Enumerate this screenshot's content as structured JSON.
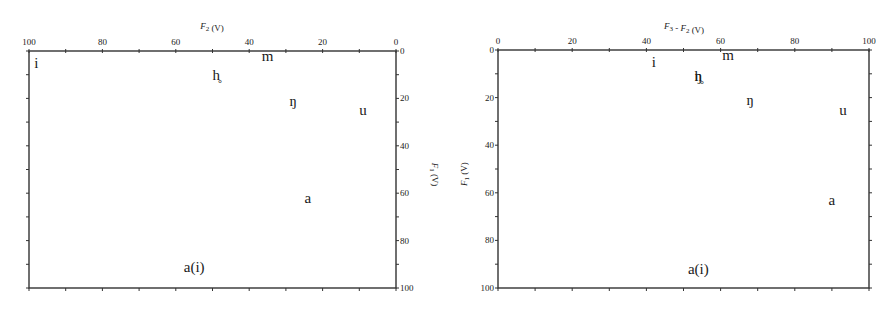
{
  "chart_data": [
    {
      "type": "scatter",
      "title": "",
      "xlabel": "F2 (V)",
      "ylabel": "F1 (V)",
      "xlim": [
        100,
        0
      ],
      "ylim": [
        100,
        0
      ],
      "x_reversed": true,
      "y_reversed": true,
      "x_axis_position": "top",
      "y_axis_position": "right",
      "x_ticks": [
        "100",
        "80",
        "60",
        "40",
        "20",
        "0"
      ],
      "y_ticks": [
        "0",
        "20",
        "40",
        "60",
        "80",
        "100"
      ],
      "grid": false,
      "legend": null,
      "points": [
        {
          "label": "i",
          "x": 98,
          "y": 5
        },
        {
          "label": "m",
          "x": 35,
          "y": 2
        },
        {
          "label": "h̥",
          "x": 49,
          "y": 10
        },
        {
          "label": "ŋ",
          "x": 28,
          "y": 21
        },
        {
          "label": "u",
          "x": 9,
          "y": 25
        },
        {
          "label": "a",
          "x": 24,
          "y": 62
        },
        {
          "label": "a(i)",
          "x": 55,
          "y": 91
        }
      ]
    },
    {
      "type": "scatter",
      "title": "",
      "xlabel": "F3 - F2 (V)",
      "ylabel": "F1 (V)",
      "xlim": [
        0,
        100
      ],
      "ylim": [
        100,
        0
      ],
      "x_reversed": false,
      "y_reversed": true,
      "x_axis_position": "top",
      "y_axis_position": "left",
      "x_ticks": [
        "0",
        "20",
        "40",
        "60",
        "80",
        "100"
      ],
      "y_ticks": [
        "0",
        "20",
        "40",
        "60",
        "80",
        "100"
      ],
      "grid": false,
      "legend": null,
      "points": [
        {
          "label": "i",
          "x": 42,
          "y": 5
        },
        {
          "label": "m",
          "x": 62,
          "y": 2
        },
        {
          "label": "h̥",
          "x": 54,
          "y": 11
        },
        {
          "label": "ŋ",
          "x": 54,
          "y": 11
        },
        {
          "label": "ŋ",
          "x": 68,
          "y": 21
        },
        {
          "label": "u",
          "x": 93,
          "y": 25
        },
        {
          "label": "a",
          "x": 90,
          "y": 63
        },
        {
          "label": "a(i)",
          "x": 54,
          "y": 92
        }
      ]
    }
  ]
}
